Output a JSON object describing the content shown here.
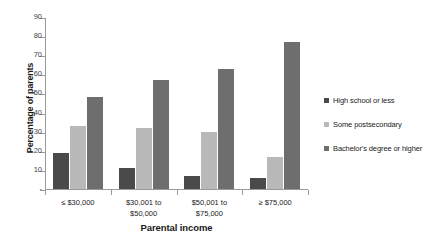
{
  "chart_data": {
    "type": "bar",
    "title": "",
    "xlabel": "Parental income",
    "ylabel": "Percentage of parents",
    "categories": [
      "≤ $30,000",
      "$30,001 to\n$50,000",
      "$50,001 to\n$75,000",
      "≥ $75,000"
    ],
    "series": [
      {
        "name": "High school or less",
        "color": "#4a4a4a",
        "values": [
          19,
          11,
          7,
          6
        ]
      },
      {
        "name": "Some postsecondary",
        "color": "#b9b9b9",
        "values": [
          33,
          32,
          30,
          17
        ]
      },
      {
        "name": "Bachelor's degree or higher",
        "color": "#6e6e6e",
        "values": [
          48,
          57,
          63,
          77
        ]
      }
    ],
    "ylim": [
      0,
      90
    ],
    "yticks": [
      0,
      10,
      20,
      30,
      40,
      50,
      60,
      70,
      80,
      90
    ],
    "ytick_labels": [
      "-",
      "10",
      "20",
      "30",
      "40",
      "50",
      "60",
      "70",
      "80",
      "90"
    ],
    "grid": false,
    "legend_position": "right"
  },
  "axes": {
    "y_title": "Percentage of parents",
    "x_title": "Parental income"
  },
  "legend": {
    "items": [
      {
        "label": "High school or less",
        "swatch": "legend-swatch-high-school"
      },
      {
        "label": "Some postsecondary",
        "swatch": "legend-swatch-some-postsecondary"
      },
      {
        "label": "Bachelor's degree or higher",
        "swatch": "legend-swatch-bachelors"
      }
    ]
  }
}
